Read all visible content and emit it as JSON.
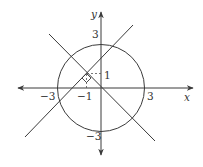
{
  "diagram": {
    "axes": {
      "x_label": "x",
      "y_label": "y"
    },
    "tick_labels": {
      "x_pos3": "3",
      "x_neg3": "−3",
      "x_neg1": "−1",
      "y_pos3": "3",
      "y_neg3": "−3",
      "y_pos1": "1"
    },
    "circle": {
      "center": [
        0,
        0
      ],
      "radius": 3
    },
    "lines": [
      {
        "name": "y = -x",
        "through": [
          0,
          0
        ],
        "slope": -1
      },
      {
        "name": "y = x + 2",
        "through": [
          -1,
          1
        ],
        "slope": 1
      }
    ],
    "right_angle_at": [
      -1,
      1
    ],
    "colors": {
      "stroke": "#3a3a3a",
      "text": "#333333",
      "background": "#ffffff"
    }
  }
}
